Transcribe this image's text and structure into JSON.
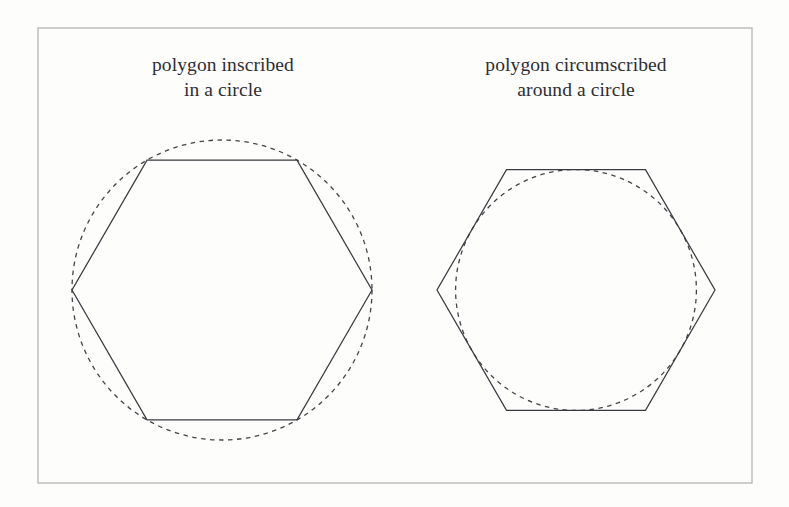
{
  "figure": {
    "background_color": "#fdfdfc",
    "frame": {
      "name": "outer-border",
      "x": 38,
      "y": 28,
      "width": 714,
      "height": 455,
      "stroke_color": "#b9b9bb",
      "stroke_width": 1.4
    },
    "stroke_color": "#3a3a40",
    "dash_color": "#44444a",
    "panels": [
      {
        "id": "inscribed",
        "caption_line1": "polygon inscribed",
        "caption_line2": "in a circle",
        "polygon": {
          "name": "hexagon-inscribed",
          "sides": 6,
          "center_x": 222,
          "center_y": 290,
          "circumradius": 150,
          "orientation": "flat-top",
          "style": "solid",
          "stroke_width": 1.25
        },
        "circle": {
          "name": "circumscribing-circle",
          "center_x": 222,
          "center_y": 290,
          "radius": 150,
          "style": "dashed",
          "dash_length": 4.5,
          "dash_gap": 4.5,
          "stroke_width": 1.3
        },
        "relation": "circle passes through all six polygon vertices"
      },
      {
        "id": "circumscribed",
        "caption_line1": "polygon circumscribed",
        "caption_line2": "around a circle",
        "polygon": {
          "name": "hexagon-circumscribed",
          "sides": 6,
          "center_x": 576,
          "center_y": 290,
          "circumradius": 139,
          "orientation": "flat-top",
          "style": "solid",
          "stroke_width": 1.25
        },
        "circle": {
          "name": "inscribed-circle",
          "center_x": 576,
          "center_y": 290,
          "radius": 120.4,
          "style": "dashed",
          "dash_length": 4.5,
          "dash_gap": 4.5,
          "stroke_width": 1.3
        },
        "relation": "circle is tangent to the midpoint of every polygon side"
      }
    ]
  }
}
